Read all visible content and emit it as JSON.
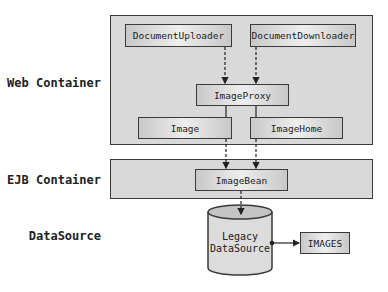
{
  "layers": {
    "web": "Web Container",
    "ejb": "EJB Container",
    "datasource": "DataSource"
  },
  "components": {
    "uploader": "DocumentUploader",
    "downloader": "DocumentDownloader",
    "proxy": "ImageProxy",
    "image": "Image",
    "image_home": "ImageHome",
    "image_bean": "ImageBean",
    "legacy_line1": "Legacy",
    "legacy_line2": "DataSource",
    "images_table": "IMAGES"
  },
  "colors": {
    "container_fill": "#d9d9d9",
    "border": "#3a3a3a"
  }
}
